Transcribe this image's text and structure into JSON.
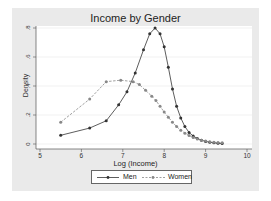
{
  "chart_data": {
    "type": "line",
    "title": "Income by Gender",
    "xlabel": "Log (Income)",
    "ylabel": "Density",
    "xlim": [
      5,
      10
    ],
    "ylim": [
      0,
      0.8
    ],
    "x_ticks": [
      "5",
      "6",
      "7",
      "8",
      "9",
      "10"
    ],
    "y_ticks": [
      "0",
      ".2",
      ".4",
      ".6",
      ".8"
    ],
    "grid": true,
    "legend_position": "bottom",
    "series": [
      {
        "name": "Men",
        "style": "solid",
        "color": "#333333",
        "x": [
          5.5,
          6.2,
          6.6,
          6.9,
          7.1,
          7.3,
          7.5,
          7.65,
          7.78,
          7.9,
          8.0,
          8.1,
          8.2,
          8.3,
          8.4,
          8.5,
          8.6,
          8.7,
          8.8,
          8.9,
          9.0,
          9.1,
          9.2,
          9.3,
          9.4
        ],
        "values": [
          0.06,
          0.11,
          0.16,
          0.27,
          0.36,
          0.49,
          0.65,
          0.76,
          0.8,
          0.76,
          0.67,
          0.53,
          0.38,
          0.26,
          0.18,
          0.12,
          0.08,
          0.055,
          0.038,
          0.026,
          0.018,
          0.012,
          0.008,
          0.006,
          0.004
        ]
      },
      {
        "name": "Women",
        "style": "dashed",
        "color": "#888888",
        "x": [
          5.5,
          6.2,
          6.6,
          6.95,
          7.25,
          7.4,
          7.55,
          7.7,
          7.8,
          7.9,
          8.0,
          8.1,
          8.2,
          8.3,
          8.4,
          8.5,
          8.6,
          8.7,
          8.8,
          8.9,
          9.0,
          9.1,
          9.2,
          9.3,
          9.4
        ],
        "values": [
          0.15,
          0.31,
          0.43,
          0.44,
          0.43,
          0.41,
          0.37,
          0.33,
          0.3,
          0.26,
          0.22,
          0.185,
          0.15,
          0.12,
          0.095,
          0.075,
          0.058,
          0.044,
          0.034,
          0.026,
          0.02,
          0.015,
          0.012,
          0.01,
          0.008
        ]
      }
    ]
  },
  "legend": {
    "men": "Men",
    "women": "Women"
  }
}
